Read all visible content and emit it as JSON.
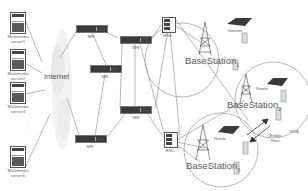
{
  "diagram": {
    "type": "mobile-multimedia-network-topology",
    "internet_label": "Internet",
    "servers": [
      {
        "label_line1": "Multimedia",
        "label_line2": "server1"
      },
      {
        "label_line1": "Multimedia",
        "label_line2": "server2"
      },
      {
        "label_line1": "Multimedia",
        "label_line2": "server3"
      },
      {
        "label_line1": "Multimedia",
        "label_line2": "serverk"
      }
    ],
    "ellipsis": "......",
    "routers": [
      {
        "label": "MR"
      },
      {
        "label": "MR"
      },
      {
        "label": "MR"
      },
      {
        "label": "MR"
      },
      {
        "label": "MR"
      }
    ],
    "rncs": [
      {
        "label": "RNC"
      },
      {
        "label": "RNC"
      }
    ],
    "base_stations": [
      {
        "label": "BaseStation",
        "subscript": "1"
      },
      {
        "label": "BaseStation",
        "subscript": "2"
      },
      {
        "label": "BaseStation",
        "subscript": "3"
      }
    ],
    "devices": {
      "notebook1": "Notebo",
      "notebook2": "Noteb",
      "notebook3": "Noteb",
      "pda": "PDA",
      "mobile_host_line1": "Mobile",
      "mobile_host_line2": "Host"
    },
    "colors": {
      "line": "#777777",
      "device_dark": "#3a3a3a",
      "text": "#666666"
    }
  }
}
